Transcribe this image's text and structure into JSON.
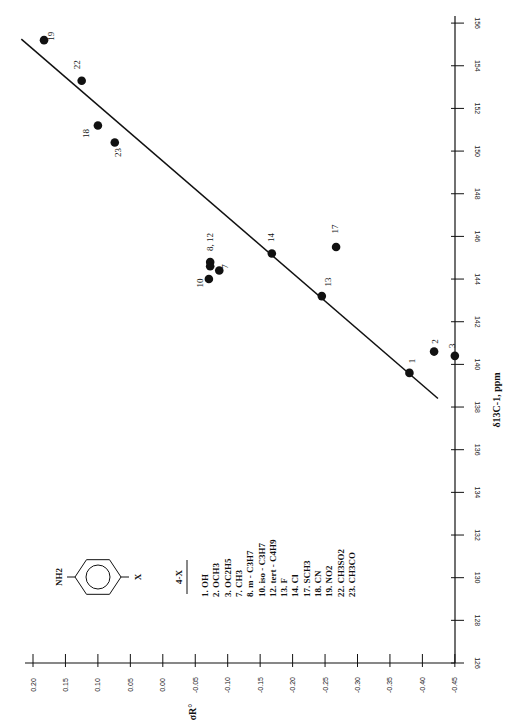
{
  "chart_data": {
    "type": "scatter",
    "orientation": "rotated-90-ccw",
    "title": "",
    "xlabel": "δ13C-1, ppm",
    "ylabel": "σR°",
    "xlim": [
      126,
      156
    ],
    "ylim": [
      -0.45,
      0.2
    ],
    "x_ticks": [
      126,
      128,
      130,
      132,
      134,
      136,
      138,
      140,
      142,
      144,
      146,
      148,
      150,
      152,
      154,
      156
    ],
    "y_ticks": [
      "0.20",
      "0.15",
      "0.10",
      "0.05",
      "0.00",
      "-0.05",
      "-0.10",
      "-0.15",
      "-0.20",
      "-0.25",
      "-0.30",
      "-0.35",
      "-0.40",
      "-0.45"
    ],
    "grid": false,
    "points": [
      {
        "label": "1",
        "x": 139.6,
        "y": -0.38
      },
      {
        "label": "2",
        "x": 140.6,
        "y": -0.418
      },
      {
        "label": "3",
        "x": 140.4,
        "y": -0.45
      },
      {
        "label": "7",
        "x": 144.4,
        "y": -0.087
      },
      {
        "label": "8, 12",
        "x": 144.8,
        "y": -0.073
      },
      {
        "label": "",
        "x": 144.6,
        "y": -0.073
      },
      {
        "label": "10",
        "x": 144.0,
        "y": -0.071
      },
      {
        "label": "13",
        "x": 143.2,
        "y": -0.245
      },
      {
        "label": "14",
        "x": 145.2,
        "y": -0.168
      },
      {
        "label": "17",
        "x": 145.5,
        "y": -0.267
      },
      {
        "label": "18",
        "x": 151.2,
        "y": 0.1
      },
      {
        "label": "19",
        "x": 155.2,
        "y": 0.183
      },
      {
        "label": "22",
        "x": 153.3,
        "y": 0.125
      },
      {
        "label": "23",
        "x": 150.4,
        "y": 0.074
      }
    ],
    "fit_line": {
      "x1": 155.25,
      "y1": 0.218,
      "x2": 138.4,
      "y2": -0.424
    },
    "legend": {
      "title": "4-X",
      "molecule": {
        "substituent_top": "NH2",
        "substituent_bottom": "X"
      },
      "entries": [
        "1. OH",
        "2. OCH3",
        "3. OC2H5",
        "7. CH3",
        "8. m - C3H7",
        "10. iso - C3H7",
        "12. tert - C4H9",
        "13. F",
        "14. Cl",
        "17. SCH3",
        "18. CN",
        "19. NO2",
        "22. CH3SO2",
        "23. CH3CO"
      ]
    }
  },
  "colors": {
    "ink": "#111111",
    "background": "#ffffff"
  }
}
